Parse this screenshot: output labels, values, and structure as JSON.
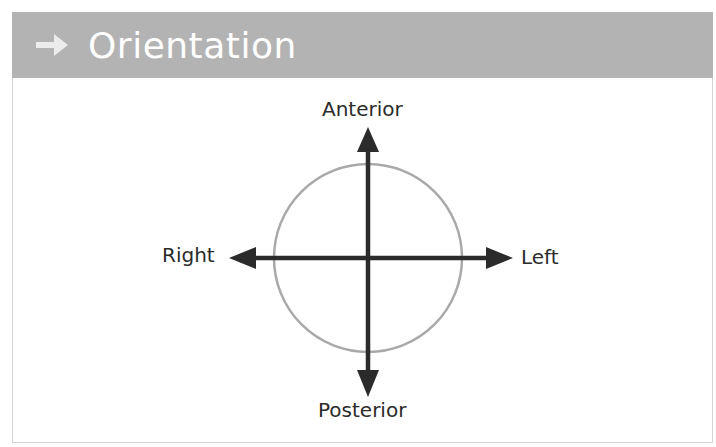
{
  "header": {
    "icon": "right-arrow-icon",
    "title": "Orientation",
    "background_color": "#b3b3b3",
    "text_color": "#ffffff"
  },
  "diagram": {
    "circle_color": "#a9a9a9",
    "arrow_color": "#2b2b2b",
    "labels": {
      "top": "Anterior",
      "bottom": "Posterior",
      "left": "Right",
      "right": "Left"
    }
  }
}
